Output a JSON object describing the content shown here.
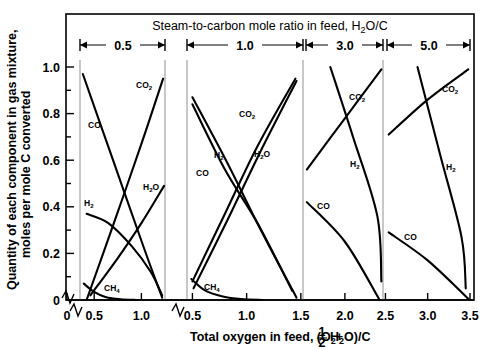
{
  "figure": {
    "top_title": "Steam-to-carbon mole ratio in feed, H2O/C",
    "top_title_parts": {
      "pre": "Steam-to-carbon mole ratio in feed, H",
      "sub": "2",
      "post": "O/C"
    },
    "x_axis_title_parts": {
      "a": "Total oxygen in feed, (O",
      "a_sub": "2",
      "b": "+ ",
      "frac_num": "1",
      "frac_den": "2",
      "c": " H",
      "c_sub": "2",
      "d": "O)/C"
    },
    "x_axis_title": "Total oxygen in feed, (O2 + 1/2 H2O)/C",
    "y_axis_title_line1": "Quantity of each component in gas mixture,",
    "y_axis_title_line2": "moles per mole C converted"
  },
  "chart_data": {
    "type": "line",
    "title": "Steam-to-carbon mole ratio in feed, H2O/C",
    "xlabel": "Total oxygen in feed, (O2 + 1/2 H2O)/C",
    "ylabel": "Quantity of each component in gas mixture, moles per mole C converted",
    "ylim": [
      0,
      1.05
    ],
    "ytick_values": [
      0.2,
      0.4,
      0.6,
      0.8,
      1.0
    ],
    "ytick_labels": [
      "0.2",
      "0.4",
      "0.6",
      "0.8",
      "1.0"
    ],
    "y_axis_break": true,
    "y_origin_label": "0",
    "grid": false,
    "legend": "inline-labels",
    "x_axis_break_between_panels": [
      2
    ],
    "panels": [
      {
        "ratio_label": "0.5",
        "xlim": [
          0.35,
          1.25
        ],
        "xticks": [
          0.5,
          1.0
        ],
        "xtick_labels": [
          "0.5",
          "1.0"
        ],
        "series": [
          {
            "name": "CO",
            "label": "CO",
            "points": [
              [
                0.38,
                0.97
              ],
              [
                0.7,
                0.6
              ],
              [
                1.03,
                0.22
              ],
              [
                1.22,
                0.01
              ]
            ]
          },
          {
            "name": "CO2",
            "label": "CO2",
            "points": [
              [
                0.42,
                0.0
              ],
              [
                0.7,
                0.32
              ],
              [
                1.0,
                0.67
              ],
              [
                1.23,
                0.95
              ]
            ]
          },
          {
            "name": "H2O",
            "label": "H2O",
            "points": [
              [
                0.46,
                0.02
              ],
              [
                0.75,
                0.18
              ],
              [
                1.0,
                0.33
              ],
              [
                1.24,
                0.49
              ]
            ]
          },
          {
            "name": "H2",
            "label": "H2",
            "points": [
              [
                0.42,
                0.37
              ],
              [
                0.65,
                0.33
              ],
              [
                0.9,
                0.23
              ],
              [
                1.1,
                0.12
              ],
              [
                1.22,
                0.02
              ]
            ]
          },
          {
            "name": "CH4",
            "label": "CH4",
            "points": [
              [
                0.39,
                0.07
              ],
              [
                0.5,
                0.035
              ],
              [
                0.62,
                0.013
              ],
              [
                0.78,
                0.003
              ],
              [
                0.95,
                0.0
              ]
            ]
          }
        ]
      },
      {
        "ratio_label": "1.0",
        "xlim": [
          0.45,
          1.52
        ],
        "xticks": [
          0.5,
          1.0,
          1.5
        ],
        "xtick_labels": [
          "0.5",
          "1.0",
          "1.5"
        ],
        "series": [
          {
            "name": "CO",
            "label": "CO",
            "points": [
              [
                0.5,
                0.84
              ],
              [
                0.8,
                0.56
              ],
              [
                1.1,
                0.33
              ],
              [
                1.42,
                0.04
              ]
            ]
          },
          {
            "name": "H2",
            "label": "H2",
            "points": [
              [
                0.5,
                0.87
              ],
              [
                0.82,
                0.59
              ],
              [
                1.12,
                0.31
              ],
              [
                1.46,
                0.01
              ]
            ]
          },
          {
            "name": "CO2",
            "label": "CO2",
            "points": [
              [
                0.5,
                0.08
              ],
              [
                0.8,
                0.37
              ],
              [
                1.1,
                0.66
              ],
              [
                1.45,
                0.95
              ]
            ]
          },
          {
            "name": "H2O",
            "label": "H2O",
            "points": [
              [
                0.51,
                0.05
              ],
              [
                0.82,
                0.34
              ],
              [
                1.12,
                0.63
              ],
              [
                1.46,
                0.94
              ]
            ]
          },
          {
            "name": "CH4",
            "label": "CH4",
            "points": [
              [
                0.49,
                0.09
              ],
              [
                0.62,
                0.04
              ],
              [
                0.78,
                0.015
              ],
              [
                0.95,
                0.004
              ],
              [
                1.15,
                0.0
              ]
            ]
          }
        ]
      },
      {
        "ratio_label": "3.0",
        "xlim": [
          1.52,
          2.47
        ],
        "xticks": [
          2.0,
          2.5
        ],
        "xtick_labels": [
          "2.0",
          "2.5"
        ],
        "series": [
          {
            "name": "CO2",
            "label": "CO2",
            "points": [
              [
                1.53,
                0.56
              ],
              [
                2.0,
                0.78
              ],
              [
                2.45,
                0.99
              ]
            ]
          },
          {
            "name": "H2",
            "label": "H2",
            "points": [
              [
                1.82,
                1.0
              ],
              [
                2.1,
                0.7
              ],
              [
                2.4,
                0.36
              ],
              [
                2.45,
                0.08
              ]
            ]
          },
          {
            "name": "CO",
            "label": "CO",
            "points": [
              [
                1.53,
                0.42
              ],
              [
                2.0,
                0.25
              ],
              [
                2.42,
                0.005
              ]
            ]
          }
        ]
      },
      {
        "ratio_label": "5.0",
        "xlim": [
          2.52,
          3.5
        ],
        "xticks": [
          3.0,
          3.5
        ],
        "xtick_labels": [
          "3.0",
          "3.5"
        ],
        "series": [
          {
            "name": "CO2",
            "label": "CO2",
            "points": [
              [
                2.54,
                0.71
              ],
              [
                3.0,
                0.86
              ],
              [
                3.48,
                0.99
              ]
            ]
          },
          {
            "name": "H2",
            "label": "H2",
            "points": [
              [
                2.88,
                1.0
              ],
              [
                3.15,
                0.62
              ],
              [
                3.4,
                0.27
              ],
              [
                3.45,
                0.05
              ]
            ]
          },
          {
            "name": "CO",
            "label": "CO",
            "points": [
              [
                2.54,
                0.29
              ],
              [
                3.0,
                0.17
              ],
              [
                3.48,
                0.005
              ]
            ]
          }
        ]
      }
    ]
  }
}
